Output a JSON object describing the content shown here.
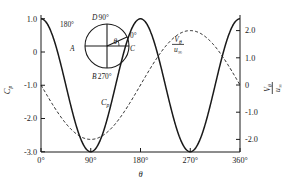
{
  "figure": {
    "background": "#ffffff",
    "ink": "#1a1a1a"
  },
  "axes": {
    "x": {
      "label": "θ",
      "ticks": [
        "0°",
        "90°",
        "180°",
        "270°",
        "360°"
      ],
      "values": [
        0,
        90,
        180,
        270,
        360
      ],
      "range": [
        0,
        360
      ]
    },
    "y_left": {
      "label": "C",
      "label_sub": "p",
      "ticks": [
        "1.0",
        "0",
        "-1.0",
        "-2.0",
        "-3.0"
      ],
      "values": [
        1.0,
        0,
        -1.0,
        -2.0,
        -3.0
      ],
      "range": [
        -3.0,
        1.0
      ]
    },
    "y_right": {
      "label_num": "V",
      "label_num_sub": "θ",
      "label_den": "u",
      "label_den_sub": "∞",
      "ticks": [
        "2.0",
        "1.0",
        "0",
        "-1.0",
        "-2.0"
      ],
      "values": [
        2.0,
        1.0,
        0,
        -1.0,
        -2.0
      ],
      "range": [
        -2.5,
        2.5
      ]
    }
  },
  "curve_labels": {
    "cp": {
      "text": "C",
      "sub": "p",
      "x": 105,
      "y": 102
    },
    "vtheta": {
      "num": "V",
      "num_sub": "θ",
      "den": "u",
      "den_sub": "∞",
      "x": 176,
      "y": 42
    }
  },
  "inset": {
    "name": "cylinder-angle-diagram",
    "center_x": 107,
    "center_y": 46,
    "radius": 22,
    "theta_symbol": "θ",
    "points": [
      {
        "id": "A",
        "label": "A",
        "angle_label": "180°",
        "position": "left"
      },
      {
        "id": "B",
        "label": "B",
        "angle_label": "270°",
        "position": "bottom"
      },
      {
        "id": "C",
        "label": "C",
        "angle_label": "0°",
        "position": "right"
      },
      {
        "id": "D",
        "label": "D",
        "angle_label": "90°",
        "position": "top"
      }
    ]
  },
  "chart_data": {
    "type": "line",
    "title": "",
    "xlabel": "θ",
    "ylabel": "C_p",
    "y2label": "V_θ/u_∞",
    "xlim": [
      0,
      360
    ],
    "ylim": [
      -3.0,
      1.0
    ],
    "y2lim": [
      -2.5,
      2.5
    ],
    "grid": false,
    "legend": "inline-labels",
    "series": [
      {
        "name": "C_p",
        "axis": "left",
        "style": "solid",
        "formula": "Cp = 1 - 4 sin^2(theta)",
        "x": [
          0,
          15,
          30,
          45,
          60,
          75,
          90,
          105,
          120,
          135,
          150,
          165,
          180,
          195,
          210,
          225,
          240,
          255,
          270,
          285,
          300,
          315,
          330,
          345,
          360
        ],
        "values": [
          1.0,
          0.73,
          0.0,
          -1.0,
          -2.0,
          -2.73,
          -3.0,
          -2.73,
          -2.0,
          -1.0,
          0.0,
          0.73,
          1.0,
          0.73,
          0.0,
          -1.0,
          -2.0,
          -2.73,
          -3.0,
          -2.73,
          -2.0,
          -1.0,
          0.0,
          0.73,
          1.0
        ]
      },
      {
        "name": "V_θ/u_∞",
        "axis": "right",
        "style": "dashed",
        "formula": "Vtheta/uinf = -2 sin(theta)",
        "x": [
          0,
          15,
          30,
          45,
          60,
          75,
          90,
          105,
          120,
          135,
          150,
          165,
          180,
          195,
          210,
          225,
          240,
          255,
          270,
          285,
          300,
          315,
          330,
          345,
          360
        ],
        "values": [
          0.0,
          -0.52,
          -1.0,
          -1.41,
          -1.73,
          -1.93,
          -2.0,
          -1.93,
          -1.73,
          -1.41,
          -1.0,
          -0.52,
          0.0,
          0.52,
          1.0,
          1.41,
          1.73,
          1.93,
          2.0,
          1.93,
          1.73,
          1.41,
          1.0,
          0.52,
          0.0
        ]
      }
    ],
    "annotations": [
      {
        "text": "C_p",
        "x": 150,
        "y": -1.6
      },
      {
        "text": "V_θ/u_∞",
        "x": 245,
        "y": 0.95
      }
    ]
  }
}
